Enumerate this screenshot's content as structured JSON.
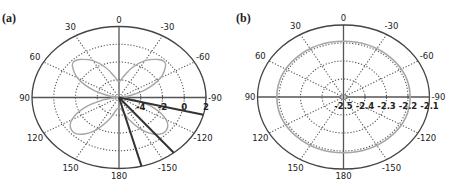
{
  "chart_data": [
    {
      "type": "line",
      "subtype": "polar",
      "panel_label": "(a)",
      "angle_direction": "clockwise-negative",
      "angle_zero": "top",
      "angular_ticks": [
        0,
        -30,
        -60,
        -90,
        -120,
        -150,
        180,
        150,
        120,
        90,
        60,
        30
      ],
      "angular_tick_labels": [
        "0",
        "-30",
        "-60",
        "-90",
        "-120",
        "-150",
        "180",
        "150",
        "120",
        "90",
        "60",
        "30"
      ],
      "radial_range": [
        -6,
        2
      ],
      "radial_ticks": [
        -4,
        -2,
        0,
        2
      ],
      "radial_tick_labels": [
        "-4",
        "-2",
        "0",
        "2"
      ],
      "grid": true,
      "series": [
        {
          "name": "pattern",
          "color": "#a6a6a6",
          "kind": "curve",
          "theta_deg": [
            0,
            10,
            20,
            30,
            40,
            45,
            50,
            60,
            70,
            80,
            90,
            100,
            110,
            120,
            130,
            140,
            150,
            160,
            170,
            180,
            -170,
            -160,
            -150,
            -140,
            -130,
            -120,
            -110,
            -100,
            -90,
            -80,
            -70,
            -60,
            -50,
            -45,
            -40,
            -30,
            -20,
            -10
          ],
          "r": [
            -4.2,
            -3.6,
            -2.4,
            -1.2,
            -0.4,
            -0.2,
            -0.4,
            -1.6,
            -3.4,
            -5.2,
            -6.0,
            -4.6,
            -2.6,
            -1.0,
            -0.3,
            -0.6,
            -1.8,
            -3.4,
            -4.6,
            -4.8,
            -4.6,
            -3.4,
            -1.8,
            -0.6,
            -0.3,
            -1.0,
            -2.6,
            -4.6,
            -6.0,
            -5.2,
            -3.4,
            -1.6,
            -0.4,
            -0.2,
            -0.4,
            -1.2,
            -2.4,
            -3.6
          ]
        },
        {
          "name": "beams",
          "color": "#333333",
          "kind": "radial-lines",
          "theta_deg": [
            -165,
            -141,
            -104
          ],
          "r": [
            2,
            2,
            2
          ]
        }
      ]
    },
    {
      "type": "line",
      "subtype": "polar",
      "panel_label": "(b)",
      "angle_direction": "clockwise-negative",
      "angle_zero": "top",
      "angular_ticks": [
        0,
        -30,
        -60,
        -90,
        -120,
        -150,
        180,
        150,
        120,
        90,
        60,
        30
      ],
      "angular_tick_labels": [
        "0",
        "-30",
        "-60",
        "-90",
        "-120",
        "-150",
        "180",
        "150",
        "120",
        "90",
        "60",
        "30"
      ],
      "radial_range": [
        -2.5,
        -2.1
      ],
      "radial_ticks": [
        -2.5,
        -2.4,
        -2.3,
        -2.2,
        -2.1
      ],
      "radial_tick_labels": [
        "-2.5",
        "-2.4",
        "-2.3",
        "-2.2",
        "-2.1"
      ],
      "grid": true,
      "series": [
        {
          "name": "pattern",
          "color": "#a6a6a6",
          "kind": "circle",
          "r_constant": -2.19
        }
      ]
    }
  ]
}
